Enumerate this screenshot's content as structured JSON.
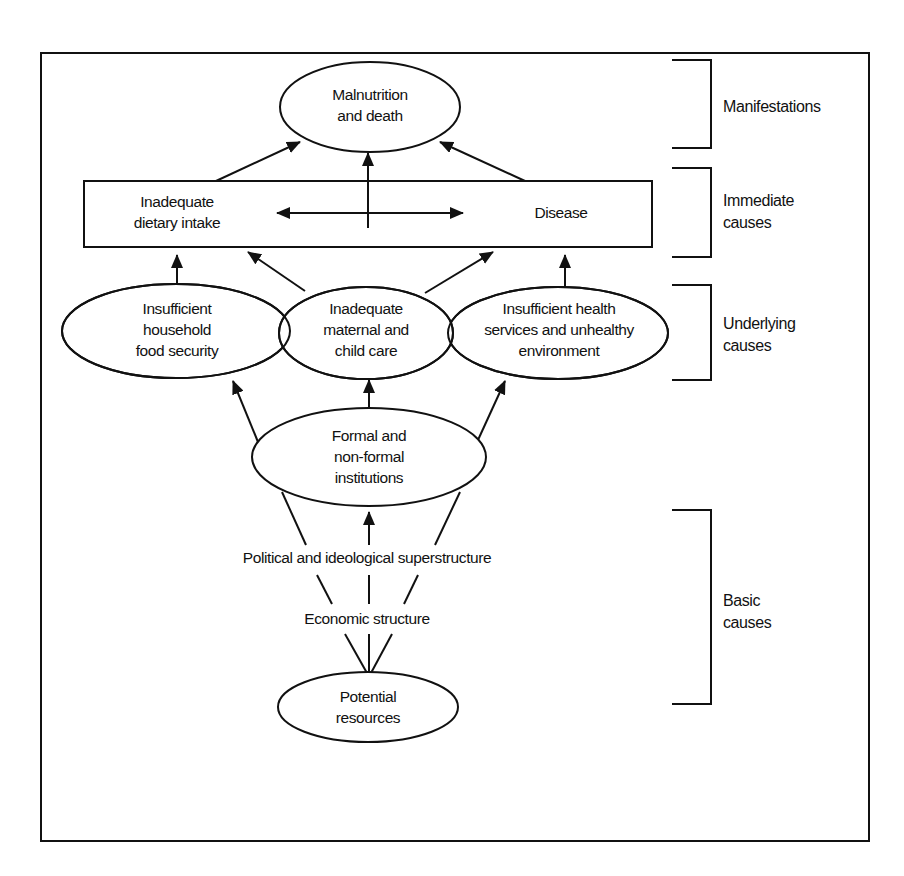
{
  "diagram": {
    "type": "conceptual-framework",
    "colors": {
      "stroke": "#111111",
      "background": "#ffffff"
    },
    "nodes": {
      "malnutrition": {
        "line1": "Malnutrition",
        "line2": "and death"
      },
      "dietary_intake": {
        "line1": "Inadequate",
        "line2": "dietary intake"
      },
      "disease": {
        "label": "Disease"
      },
      "food_security": {
        "line1": "Insufficient",
        "line2": "household",
        "line3": "food security"
      },
      "maternal_care": {
        "line1": "Inadequate",
        "line2": "maternal and",
        "line3": "child care"
      },
      "health_services": {
        "line1": "Insufficient health",
        "line2": "services and unhealthy",
        "line3": "environment"
      },
      "institutions": {
        "line1": "Formal and",
        "line2": "non-formal",
        "line3": "institutions"
      },
      "political": {
        "label": "Political and ideological superstructure"
      },
      "economic": {
        "label": "Economic structure"
      },
      "resources": {
        "line1": "Potential",
        "line2": "resources"
      }
    },
    "levels": [
      {
        "line1": "Manifestations"
      },
      {
        "line1": "Immediate",
        "line2": "causes"
      },
      {
        "line1": "Underlying",
        "line2": "causes"
      },
      {
        "line1": "Basic",
        "line2": "causes"
      }
    ],
    "edges": [
      {
        "from": "dietary_intake",
        "to": "malnutrition"
      },
      {
        "from": "immediate_box",
        "to": "malnutrition"
      },
      {
        "from": "disease",
        "to": "malnutrition"
      },
      {
        "from": "dietary_intake",
        "to": "disease",
        "bidirectional": true
      },
      {
        "from": "food_security",
        "to": "dietary_intake"
      },
      {
        "from": "maternal_care",
        "to": "dietary_intake"
      },
      {
        "from": "maternal_care",
        "to": "disease"
      },
      {
        "from": "health_services",
        "to": "disease"
      },
      {
        "from": "institutions",
        "to": "food_security"
      },
      {
        "from": "institutions",
        "to": "maternal_care"
      },
      {
        "from": "institutions",
        "to": "health_services"
      },
      {
        "from": "political",
        "to": "institutions"
      },
      {
        "from": "economic",
        "to": "political"
      },
      {
        "from": "resources",
        "to": "economic"
      }
    ]
  }
}
